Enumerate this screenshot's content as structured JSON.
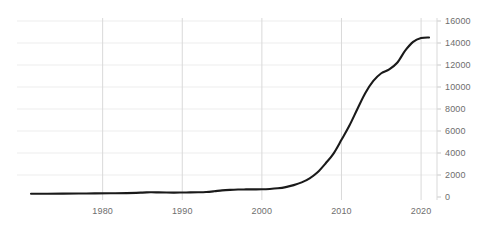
{
  "chart_data": {
    "type": "line",
    "title": "",
    "subtitle": "",
    "xlabel": "",
    "ylabel": "",
    "xlim": [
      1971,
      2022
    ],
    "ylim": [
      0,
      16000
    ],
    "grid": true,
    "legend": null,
    "legend_position": "none",
    "xticks": [
      "1980",
      "1990",
      "2000",
      "2010",
      "2020"
    ],
    "xtick_values": [
      1980,
      1990,
      2000,
      2010,
      2020
    ],
    "yticks": [
      "0",
      "2000",
      "4000",
      "6000",
      "8000",
      "10000",
      "12000",
      "14000",
      "16000"
    ],
    "ytick_values": [
      0,
      2000,
      4000,
      6000,
      8000,
      10000,
      12000,
      14000,
      16000
    ],
    "y_axis_position": "right",
    "line_color": "#1a1a1a",
    "grid_color": "#e8e8e8",
    "tick_label_color": "#6e6e6e",
    "series": [
      {
        "name": "series-1",
        "x": [
          1971,
          1973,
          1975,
          1977,
          1979,
          1981,
          1983,
          1985,
          1986,
          1987,
          1988,
          1989,
          1990,
          1991,
          1992,
          1993,
          1994,
          1995,
          1996,
          1997,
          1998,
          1999,
          2000,
          2001,
          2002,
          2003,
          2004,
          2005,
          2006,
          2007,
          2008,
          2009,
          2010,
          2011,
          2012,
          2013,
          2014,
          2015,
          2016,
          2017,
          2018,
          2019,
          2020,
          2021
        ],
        "y": [
          300,
          300,
          310,
          320,
          330,
          340,
          355,
          400,
          430,
          420,
          405,
          400,
          410,
          420,
          430,
          455,
          520,
          600,
          650,
          680,
          690,
          695,
          700,
          730,
          790,
          900,
          1080,
          1330,
          1700,
          2250,
          3050,
          3950,
          5200,
          6500,
          8000,
          9450,
          10550,
          11250,
          11600,
          12200,
          13300,
          14100,
          14450,
          14500
        ]
      }
    ]
  }
}
